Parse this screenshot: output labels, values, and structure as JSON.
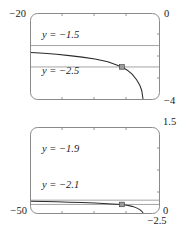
{
  "figure": {
    "background_color": "#ffffff",
    "frame_color": "#8a8a8a",
    "curve_color": "#2b2b2b",
    "gridline_color": "#9a9a9a"
  },
  "chart_data": [
    {
      "type": "line",
      "id": "top-panel",
      "title": "",
      "xlabel": "",
      "ylabel": "",
      "xlim": [
        -20,
        0
      ],
      "ylim": [
        -4,
        0
      ],
      "grid": true,
      "legend_position": "none",
      "corner_labels": {
        "top_left": "−20",
        "top_right": "0",
        "bottom_right": "−4"
      },
      "gridlines": [
        {
          "label": "y = −1.5",
          "value": -1.5
        },
        {
          "label": "y = −2.5",
          "value": -2.5
        }
      ],
      "annotations": [
        {
          "text": "y = −1.5",
          "x": -16.0,
          "y": -1.2
        },
        {
          "text": "y = −2.5",
          "x": -16.0,
          "y": -2.85
        }
      ],
      "marker_point": {
        "x": -5.8,
        "y": -2.5
      },
      "series": [
        {
          "name": "curve",
          "x": [
            -20.0,
            -18.0,
            -16.0,
            -14.0,
            -12.0,
            -10.0,
            -8.0,
            -6.5,
            -5.8,
            -5.0,
            -4.2,
            -3.5,
            -3.0,
            -2.7,
            -2.5
          ],
          "y": [
            -1.82,
            -1.86,
            -1.91,
            -1.97,
            -2.04,
            -2.13,
            -2.26,
            -2.42,
            -2.5,
            -2.64,
            -2.84,
            -3.1,
            -3.36,
            -3.6,
            -4.0
          ]
        }
      ]
    },
    {
      "type": "line",
      "id": "bottom-panel",
      "title": "",
      "xlabel": "",
      "ylabel": "",
      "xlim": [
        -50,
        0
      ],
      "ylim": [
        -2.5,
        1.5
      ],
      "grid": true,
      "legend_position": "none",
      "corner_labels": {
        "top_right": "1.5",
        "bottom_left": "−50",
        "right": "0",
        "bottom_right": "−2.5"
      },
      "gridlines": [
        {
          "label": "y = −1.9",
          "value": -1.9
        },
        {
          "label": "y = −2.1",
          "value": -2.1
        }
      ],
      "annotations": [
        {
          "text": "y = −1.9",
          "x": -40.0,
          "y": -1.62
        },
        {
          "text": "y = −2.1",
          "x": -40.0,
          "y": -2.24
        }
      ],
      "marker_point": {
        "x": -14.5,
        "y": -2.1
      },
      "series": [
        {
          "name": "curve",
          "x": [
            -50.0,
            -45.0,
            -40.0,
            -35.0,
            -30.0,
            -25.0,
            -20.0,
            -16.5,
            -14.5,
            -12.5,
            -10.5,
            -8.8,
            -7.5,
            -6.7,
            -6.2
          ],
          "y": [
            -1.955,
            -1.965,
            -1.978,
            -1.993,
            -2.012,
            -2.036,
            -2.068,
            -2.088,
            -2.1,
            -2.135,
            -2.19,
            -2.26,
            -2.34,
            -2.42,
            -2.5
          ]
        }
      ]
    }
  ]
}
